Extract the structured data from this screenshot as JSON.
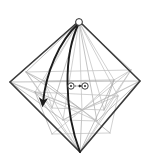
{
  "figure": {
    "type": "geometric-mesh-diagram",
    "canvas": {
      "width": 149,
      "height": 160
    },
    "background_color": "#ffffff",
    "title": "",
    "caption": ""
  },
  "colors": {
    "outline": "#3b3b3b",
    "mesh": "#a8a8a8",
    "mesh_light": "#bdbdbd",
    "trajectory": "#1c1c1c",
    "marker_stroke": "#2b2b2b",
    "dashed_arrow": "#2b2b2b",
    "node_fill": "#ffffff"
  },
  "outline": {
    "name": "rhombus-outline",
    "stroke_width": 1.6,
    "vertices": [
      {
        "label": "top",
        "x": 79,
        "y": 21
      },
      {
        "label": "right",
        "x": 140,
        "y": 81
      },
      {
        "label": "bottom",
        "x": 80,
        "y": 152
      },
      {
        "label": "left",
        "x": 10,
        "y": 82
      }
    ]
  },
  "hubs": [
    {
      "name": "apex-hub",
      "x": 79,
      "y": 22,
      "radius": 3.4
    },
    {
      "name": "lower-hub",
      "x": 82,
      "y": 110,
      "radius": 0
    }
  ],
  "mesh": {
    "stroke_width": 0.7,
    "description": "internal triangulation / spoke network",
    "segments": [
      [
        79,
        21,
        10,
        82
      ],
      [
        79,
        21,
        140,
        81
      ],
      [
        10,
        82,
        80,
        152
      ],
      [
        140,
        81,
        80,
        152
      ],
      [
        79,
        22,
        82,
        110
      ],
      [
        79,
        22,
        35,
        92
      ],
      [
        79,
        22,
        52,
        108
      ],
      [
        79,
        22,
        118,
        96
      ],
      [
        79,
        22,
        104,
        110
      ],
      [
        79,
        22,
        26,
        72
      ],
      [
        79,
        22,
        131,
        70
      ],
      [
        79,
        22,
        63,
        120
      ],
      [
        79,
        22,
        97,
        121
      ],
      [
        79,
        22,
        44,
        81
      ],
      [
        79,
        22,
        114,
        80
      ],
      [
        10,
        82,
        140,
        81
      ],
      [
        26,
        72,
        131,
        70
      ],
      [
        35,
        92,
        118,
        96
      ],
      [
        44,
        81,
        114,
        80
      ],
      [
        82,
        110,
        10,
        82
      ],
      [
        82,
        110,
        140,
        81
      ],
      [
        82,
        110,
        80,
        152
      ],
      [
        82,
        110,
        35,
        92
      ],
      [
        82,
        110,
        118,
        96
      ],
      [
        82,
        110,
        26,
        72
      ],
      [
        82,
        110,
        131,
        70
      ],
      [
        82,
        110,
        52,
        134
      ],
      [
        82,
        110,
        110,
        133
      ],
      [
        82,
        110,
        63,
        120
      ],
      [
        82,
        110,
        97,
        121
      ],
      [
        82,
        110,
        44,
        81
      ],
      [
        82,
        110,
        114,
        80
      ],
      [
        80,
        152,
        44,
        81
      ],
      [
        80,
        152,
        114,
        80
      ],
      [
        80,
        152,
        26,
        72
      ],
      [
        80,
        152,
        131,
        70
      ],
      [
        80,
        152,
        35,
        92
      ],
      [
        80,
        152,
        118,
        96
      ],
      [
        52,
        134,
        110,
        133
      ],
      [
        10,
        82,
        63,
        120
      ],
      [
        10,
        82,
        97,
        121
      ],
      [
        140,
        81,
        63,
        120
      ],
      [
        140,
        81,
        97,
        121
      ],
      [
        26,
        72,
        52,
        108
      ],
      [
        131,
        70,
        104,
        110
      ],
      [
        35,
        92,
        52,
        134
      ],
      [
        118,
        96,
        110,
        133
      ],
      [
        44,
        81,
        52,
        108
      ],
      [
        114,
        80,
        104,
        110
      ],
      [
        52,
        108,
        104,
        110
      ],
      [
        63,
        120,
        97,
        121
      ],
      [
        26,
        72,
        44,
        81
      ],
      [
        131,
        70,
        114,
        80
      ]
    ]
  },
  "trajectory": {
    "name": "trajectory-arcs",
    "stroke_width": 1.9,
    "arrowhead": {
      "x": 43,
      "y": 104,
      "angle_deg": 250
    },
    "arcs": [
      {
        "name": "trajectory-arc-outer",
        "start": {
          "x": 79,
          "y": 23
        },
        "control1": {
          "x": 58,
          "y": 42
        },
        "control2": {
          "x": 46,
          "y": 74
        },
        "end": {
          "x": 43,
          "y": 102
        }
      },
      {
        "name": "trajectory-arc-inner",
        "start": {
          "x": 79,
          "y": 23
        },
        "control1": {
          "x": 63,
          "y": 55
        },
        "control2": {
          "x": 64,
          "y": 110
        },
        "end": {
          "x": 80,
          "y": 152
        }
      }
    ]
  },
  "markers": [
    {
      "name": "marker-origin",
      "x": 71,
      "y": 86,
      "radius": 3.2,
      "dot_radius": 1.0
    },
    {
      "name": "marker-target",
      "x": 85,
      "y": 86,
      "radius": 3.2,
      "dot_radius": 1.0
    }
  ],
  "dashed_arrow": {
    "name": "displacement-arrow",
    "start": {
      "x": 75,
      "y": 86
    },
    "end": {
      "x": 81,
      "y": 86
    },
    "dash": "1.4 1.2",
    "stroke_width": 0.9
  },
  "labels": []
}
